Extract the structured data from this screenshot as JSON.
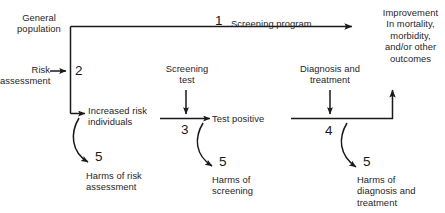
{
  "diagram": {
    "colors": {
      "line": "#1a1a1a",
      "text": "#262626",
      "background": "#ffffff"
    },
    "nodes": {
      "general_population": "General\npopulation",
      "risk_assessment": "Risk\nassessment",
      "increased_risk_individuals": "Increased risk\nindividuals",
      "screening_test": "Screening\ntest",
      "test_positive": "Test positive",
      "diagnosis_and_treatment": "Diagnosis and\ntreatment",
      "improvement": "Improvement\nIn mortality,\nmorbidity,\nand/or other\noutcomes",
      "screening_program": "Screening program",
      "harms_of_risk_assessment": "Harms of risk\nassessment",
      "harms_of_screening": "Harms of\nscreening",
      "harms_of_diagnosis_and_treatment": "Harms of\ndiagnosis and\ntreatment"
    },
    "numbers": {
      "one": "1",
      "two": "2",
      "three": "3",
      "four": "4",
      "five_risk": "5",
      "five_screening": "5",
      "five_diagnosis": "5"
    }
  }
}
